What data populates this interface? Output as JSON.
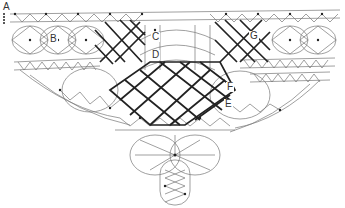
{
  "diagram": {
    "type": "lace pricking pattern",
    "labels": [
      {
        "id": "A",
        "text": "A",
        "x": 2,
        "y": 2
      },
      {
        "id": "B",
        "text": "B",
        "x": 49,
        "y": 34
      },
      {
        "id": "C",
        "text": "C",
        "x": 151,
        "y": 32
      },
      {
        "id": "D",
        "text": "D",
        "x": 151,
        "y": 50
      },
      {
        "id": "G",
        "text": "G",
        "x": 249,
        "y": 31
      },
      {
        "id": "F",
        "text": "F",
        "x": 226,
        "y": 82
      },
      {
        "id": "E",
        "text": "E",
        "x": 224,
        "y": 99
      }
    ],
    "colors": {
      "line": "#555555",
      "thick": "#222222",
      "dot": "#222222",
      "label": "#333333"
    }
  }
}
